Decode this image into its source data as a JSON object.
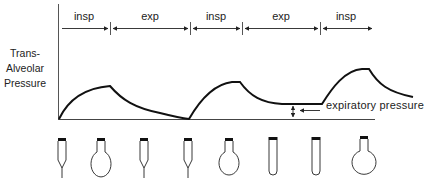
{
  "figure": {
    "y_axis_label": [
      "Trans-",
      "Alveolar",
      "Pressure"
    ],
    "phases": [
      {
        "label": "insp",
        "x0": 58,
        "x1": 110,
        "arrow_left": false,
        "arrow_right": true
      },
      {
        "label": "exp",
        "x0": 110,
        "x1": 190,
        "arrow_left": true,
        "arrow_right": true
      },
      {
        "label": "insp",
        "x0": 190,
        "x1": 242,
        "arrow_left": true,
        "arrow_right": true
      },
      {
        "label": "exp",
        "x0": 242,
        "x1": 320,
        "arrow_left": true,
        "arrow_right": true
      },
      {
        "label": "insp",
        "x0": 320,
        "x1": 372,
        "arrow_left": true,
        "arrow_right": true
      }
    ],
    "annotation": {
      "label": "expiratory pressure"
    },
    "colors": {
      "line": "#111111",
      "divider": "#555555",
      "text": "#222222"
    },
    "alveoli": [
      {
        "shape": "collapsed",
        "x": 62
      },
      {
        "shape": "inflated-small",
        "x": 101
      },
      {
        "shape": "collapsed",
        "x": 144
      },
      {
        "shape": "collapsed",
        "x": 188
      },
      {
        "shape": "inflated-small",
        "x": 229
      },
      {
        "shape": "tube",
        "x": 273
      },
      {
        "shape": "tube",
        "x": 316
      },
      {
        "shape": "inflated-large",
        "x": 365
      }
    ]
  }
}
